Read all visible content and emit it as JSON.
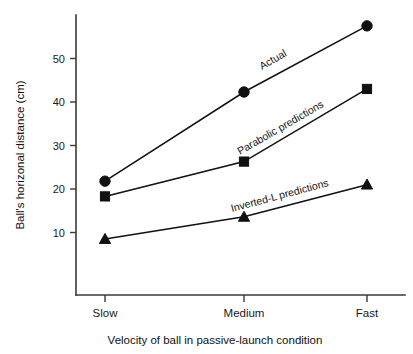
{
  "chart_data": {
    "type": "line",
    "title": "",
    "xlabel": "Velocity of ball in passive-launch condition",
    "ylabel": "Ball's horizonal distance (cm)",
    "categories": [
      "Slow",
      "Medium",
      "Fast"
    ],
    "xtick_labels": [
      "Slow",
      "Medium",
      "Fast"
    ],
    "ytick_labels": [
      "10",
      "20",
      "30",
      "40",
      "50"
    ],
    "yticks": [
      10,
      20,
      30,
      40,
      50
    ],
    "ylim": [
      0,
      60
    ],
    "grid": false,
    "legend_position": "inline-along-lines",
    "series": [
      {
        "name": "Actual",
        "label": "Actual",
        "marker": "circle",
        "values": [
          21.8,
          42.3,
          57.5
        ]
      },
      {
        "name": "Parabolic predictions",
        "label": "Parabolic predictions",
        "marker": "square",
        "values": [
          18.3,
          26.3,
          43.0
        ]
      },
      {
        "name": "Inverted-L predictions",
        "label": "Inverted-L predictions",
        "marker": "triangle",
        "values": [
          8.5,
          13.6,
          21.0
        ]
      }
    ],
    "colors": {
      "line": "#111111",
      "marker": "#111111",
      "axis": "#3a3a3a",
      "text": "#1a1a1a",
      "background": "#ffffff"
    }
  }
}
